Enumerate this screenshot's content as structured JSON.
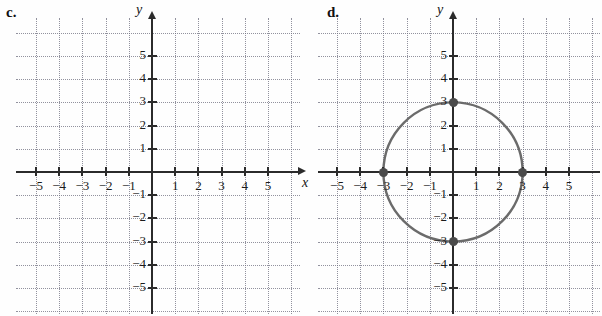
{
  "figure": {
    "kind": "coordinate-plane-pair",
    "background": "#fefefe",
    "axis_color": "#2b2b2b",
    "grid_color": "#6e6e7d",
    "curve_color": "#6b6b6b",
    "point_color": "#4a4a4a"
  },
  "panels": [
    {
      "id": "c",
      "label": "c.",
      "axis_labels": {
        "x": "x",
        "y": "y"
      },
      "x_ticks": [
        "-5",
        "-4",
        "-3",
        "-2",
        "-1",
        "1",
        "2",
        "3",
        "4",
        "5"
      ],
      "y_ticks": [
        "5",
        "4",
        "3",
        "2",
        "1",
        "-1",
        "-2",
        "-3",
        "-4",
        "-5"
      ],
      "has_x_axis_name": true,
      "content": "empty grid"
    },
    {
      "id": "d",
      "label": "d.",
      "axis_labels": {
        "x": "",
        "y": "y"
      },
      "x_ticks": [
        "-5",
        "-4",
        "-3",
        "-2",
        "-1",
        "1",
        "2",
        "3",
        "4",
        "5"
      ],
      "y_ticks": [
        "5",
        "4",
        "3",
        "2",
        "1",
        "-1",
        "-2",
        "-3",
        "-4",
        "-5"
      ],
      "has_x_axis_name": false,
      "content": "circle"
    }
  ],
  "chart_data": [
    {
      "type": "scatter",
      "title": "c.",
      "xlabel": "x",
      "ylabel": "y",
      "xlim": [
        -6,
        6
      ],
      "ylim": [
        -6,
        6
      ],
      "xticks": [
        -5,
        -4,
        -3,
        -2,
        -1,
        1,
        2,
        3,
        4,
        5
      ],
      "yticks": [
        -5,
        -4,
        -3,
        -2,
        -1,
        1,
        2,
        3,
        4,
        5
      ],
      "grid": true,
      "series": [],
      "points": [],
      "annotations": []
    },
    {
      "type": "scatter",
      "title": "d.",
      "xlabel": "",
      "ylabel": "y",
      "xlim": [
        -6,
        6
      ],
      "ylim": [
        -6,
        6
      ],
      "xticks": [
        -5,
        -4,
        -3,
        -2,
        -1,
        1,
        2,
        3,
        4,
        5
      ],
      "yticks": [
        -5,
        -4,
        -3,
        -2,
        -1,
        1,
        2,
        3,
        4,
        5
      ],
      "grid": true,
      "series": [
        {
          "name": "circle",
          "shape": "circle",
          "center": [
            0,
            0
          ],
          "radius": 3,
          "equation": "x^2 + y^2 = 9",
          "color": "#6b6b6b"
        }
      ],
      "points": [
        {
          "x": -3,
          "y": 0
        },
        {
          "x": 3,
          "y": 0
        },
        {
          "x": 0,
          "y": 3
        },
        {
          "x": 0,
          "y": -3
        }
      ],
      "annotations": []
    }
  ]
}
